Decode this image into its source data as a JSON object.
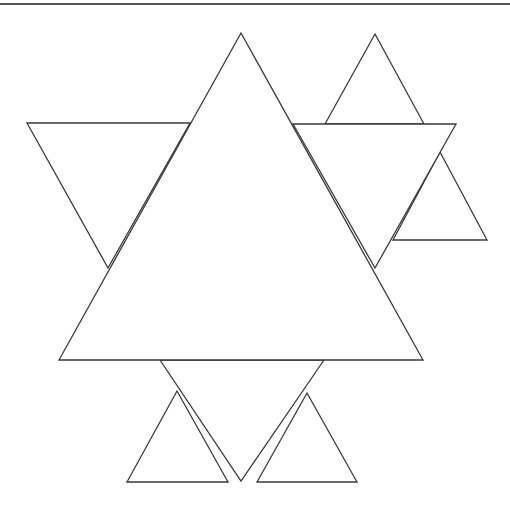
{
  "figure": {
    "stroke_color": "#3a3a3a",
    "background_color": "#ffffff",
    "top_border": {
      "x1": 0,
      "y1": 4,
      "x2": 510,
      "y2": 4,
      "color": "#555555"
    },
    "shapes": [
      {
        "name": "left-inverted-triangle",
        "points": "27,123 190,123 108,268"
      },
      {
        "name": "right-small-triangle",
        "points": "440,152 487,240 393,240"
      },
      {
        "name": "top-right-small-triangle",
        "points": "375,34 424,124 325,124"
      },
      {
        "name": "right-inverted-triangle",
        "points": "293,124 456,124 375,268"
      },
      {
        "name": "bottom-left-small-triangle",
        "points": "177,391 228,482 127,482"
      },
      {
        "name": "bottom-right-small-triangle",
        "points": "307,393 357,482 257,482"
      },
      {
        "name": "bottom-inverted-triangle",
        "points": "160,360 324,360 241,481"
      },
      {
        "name": "large-central-triangle",
        "points": "241,33 423,360 59,360"
      }
    ]
  }
}
